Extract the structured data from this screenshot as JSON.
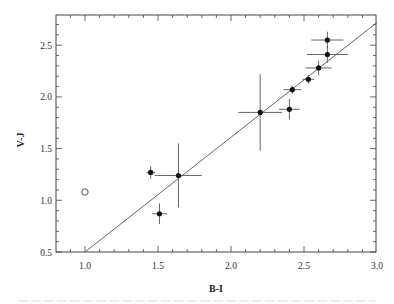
{
  "chart_data": {
    "type": "scatter",
    "title": "",
    "xlabel": "B-I",
    "ylabel": "V-J",
    "xlim": [
      0.81,
      3.0
    ],
    "ylim": [
      0.5,
      2.78
    ],
    "xticks": [
      1.0,
      1.5,
      2.0,
      2.5,
      3.0
    ],
    "xtick_labels": [
      "1.0",
      "1.5",
      "2.0",
      "2.5",
      "3.0"
    ],
    "yticks": [
      0.5,
      1.0,
      1.5,
      2.0,
      2.5
    ],
    "ytick_labels": [
      "0.5",
      "1.0",
      "1.5",
      "2.0",
      "2.5"
    ],
    "grid": false,
    "legend": null,
    "series": [
      {
        "name": "measured",
        "marker": "filled-circle",
        "points": [
          {
            "x": 1.45,
            "y": 1.27,
            "xerr": 0.03,
            "yerr": 0.06
          },
          {
            "x": 1.51,
            "y": 0.87,
            "xerr": 0.05,
            "yerr": 0.1
          },
          {
            "x": 1.64,
            "y": 1.24,
            "xerr": 0.16,
            "yerr": 0.31
          },
          {
            "x": 2.2,
            "y": 1.85,
            "xerr": 0.15,
            "yerr": 0.37
          },
          {
            "x": 2.4,
            "y": 1.88,
            "xerr": 0.07,
            "yerr": 0.1
          },
          {
            "x": 2.42,
            "y": 2.07,
            "xerr": 0.06,
            "yerr": 0.04
          },
          {
            "x": 2.53,
            "y": 2.17,
            "xerr": 0.04,
            "yerr": 0.04
          },
          {
            "x": 2.6,
            "y": 2.28,
            "xerr": 0.09,
            "yerr": 0.07
          },
          {
            "x": 2.66,
            "y": 2.41,
            "xerr": 0.14,
            "yerr": 0.08
          },
          {
            "x": 2.66,
            "y": 2.55,
            "xerr": 0.11,
            "yerr": 0.08
          }
        ]
      },
      {
        "name": "outlier",
        "marker": "open-circle",
        "points": [
          {
            "x": 1.0,
            "y": 1.08
          }
        ]
      },
      {
        "name": "fit-line",
        "type": "line",
        "points": [
          {
            "x": 1.0,
            "y": 0.5
          },
          {
            "x": 3.0,
            "y": 2.72
          }
        ]
      }
    ]
  }
}
